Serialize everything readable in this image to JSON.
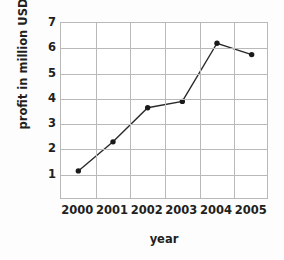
{
  "chart_data": {
    "type": "line",
    "title": "",
    "xlabel": "year",
    "ylabel": "profit in million USD",
    "categories": [
      "2000",
      "2001",
      "2002",
      "2003",
      "2004",
      "2005"
    ],
    "values": [
      1.15,
      2.3,
      3.65,
      3.9,
      6.2,
      5.75
    ],
    "series": [
      {
        "name": "profit",
        "values": [
          1.15,
          2.3,
          3.65,
          3.9,
          6.2,
          5.75
        ]
      }
    ],
    "ylim": [
      0,
      7
    ],
    "y_ticks": [
      "1",
      "2",
      "3",
      "4",
      "5",
      "6",
      "7"
    ],
    "y_tick_values": [
      1,
      2,
      3,
      4,
      5,
      6,
      7
    ],
    "grid": true,
    "legend": "none",
    "marker": "filled-circle",
    "line_color": "#2a2a2a",
    "marker_color": "#1a1a1a",
    "grid_color": "#b9b9b9",
    "background_color": "#ffffff",
    "text_color": "#231f20"
  }
}
